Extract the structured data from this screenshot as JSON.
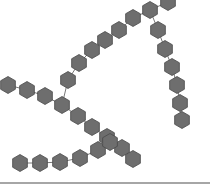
{
  "diagram": {
    "type": "branched-hexagon-chain",
    "colors": {
      "background": "#ffffff",
      "hex_fill": "#6e6e6e",
      "hex_stroke": "#4a4a4a",
      "bond": "#555555",
      "bottom_rule": "#888888"
    },
    "hex_radius": 8.5,
    "chains": [
      {
        "name": "left-chain",
        "units": [
          [
            8,
            85
          ],
          [
            27,
            90
          ],
          [
            45,
            96
          ],
          [
            62,
            105
          ]
        ]
      },
      {
        "name": "rising-branch",
        "units": [
          [
            68,
            80
          ],
          [
            79,
            63
          ],
          [
            92,
            50
          ],
          [
            105,
            40
          ],
          [
            119,
            30
          ],
          [
            133,
            18
          ],
          [
            150,
            10
          ],
          [
            168,
            2
          ]
        ]
      },
      {
        "name": "right-descending-chain",
        "units": [
          [
            158,
            30
          ],
          [
            165,
            49
          ],
          [
            172,
            67
          ],
          [
            177,
            85
          ],
          [
            180,
            103
          ],
          [
            182,
            120
          ]
        ]
      },
      {
        "name": "lower-branch",
        "units": [
          [
            78,
            116
          ],
          [
            92,
            127
          ],
          [
            107,
            137
          ],
          [
            122,
            148
          ],
          [
            133,
            159
          ]
        ]
      },
      {
        "name": "bottom-chain",
        "units": [
          [
            20,
            163
          ],
          [
            40,
            163
          ],
          [
            60,
            162
          ],
          [
            80,
            158
          ],
          [
            98,
            150
          ],
          [
            110,
            142
          ]
        ]
      }
    ],
    "branch_links": [
      [
        [
          62,
          105
        ],
        [
          68,
          80
        ]
      ],
      [
        [
          62,
          105
        ],
        [
          78,
          116
        ]
      ],
      [
        [
          150,
          10
        ],
        [
          158,
          30
        ]
      ],
      [
        [
          110,
          142
        ],
        [
          122,
          148
        ]
      ]
    ],
    "bottom_rule_y": 183
  }
}
